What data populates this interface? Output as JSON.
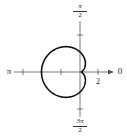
{
  "figure": {
    "type": "polar graph",
    "curve": "limacon",
    "labels": {
      "angle_0": "0",
      "angle_pi": "π",
      "angle_pi_over_2": {
        "numerator": "π",
        "denominator": "2"
      },
      "angle_3pi_over_2": {
        "numerator": "3π",
        "denominator": "2"
      },
      "tick_label": "2"
    },
    "colors": {
      "curve": "#111111",
      "axis": "#555555",
      "background": "#ffffff"
    }
  }
}
